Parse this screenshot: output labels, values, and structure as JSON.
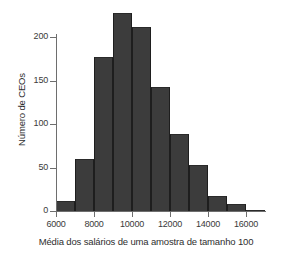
{
  "chart_data": {
    "type": "bar",
    "title": "",
    "subtitle": "",
    "xlabel": "Média dos salários de uma amostra de tamanho 100",
    "ylabel": "Número de CEOs",
    "xlim": [
      5500,
      17200
    ],
    "ylim": [
      0,
      235
    ],
    "grid": false,
    "legend": null,
    "bin_width": 1000,
    "bin_edges": [
      6000,
      7000,
      8000,
      9000,
      10000,
      11000,
      12000,
      13000,
      14000,
      15000,
      16000,
      17000
    ],
    "categories": [
      "6000-7000",
      "7000-8000",
      "8000-9000",
      "9000-10000",
      "10000-11000",
      "11000-12000",
      "12000-13000",
      "13000-14000",
      "14000-15000",
      "15000-16000",
      "16000-17000"
    ],
    "values": [
      12,
      60,
      177,
      228,
      211,
      142,
      89,
      53,
      17,
      8,
      1
    ],
    "bars": [
      {
        "x0": 6000,
        "x1": 7000,
        "value": 12
      },
      {
        "x0": 7000,
        "x1": 8000,
        "value": 60
      },
      {
        "x0": 8000,
        "x1": 9000,
        "value": 177
      },
      {
        "x0": 9000,
        "x1": 10000,
        "value": 228
      },
      {
        "x0": 10000,
        "x1": 11000,
        "value": 211
      },
      {
        "x0": 11000,
        "x1": 12000,
        "value": 142
      },
      {
        "x0": 12000,
        "x1": 13000,
        "value": 89
      },
      {
        "x0": 13000,
        "x1": 14000,
        "value": 53
      },
      {
        "x0": 14000,
        "x1": 15000,
        "value": 17
      },
      {
        "x0": 15000,
        "x1": 16000,
        "value": 8
      },
      {
        "x0": 16000,
        "x1": 17000,
        "value": 1
      }
    ],
    "xticks": [
      6000,
      8000,
      10000,
      12000,
      14000,
      16000
    ],
    "xtick_labels": [
      "6000",
      "8000",
      "10000",
      "12000",
      "14000",
      "16000"
    ],
    "yticks": [
      0,
      50,
      100,
      150,
      200
    ],
    "ytick_labels": [
      "0",
      "50",
      "100",
      "150",
      "200"
    ],
    "colors": {
      "background": "#ffffff",
      "bar_fill": "#3c3c3c",
      "bar_edge": "#1e1e1e",
      "axis": "#6e6e6e",
      "text": "#2e2e2e"
    }
  }
}
